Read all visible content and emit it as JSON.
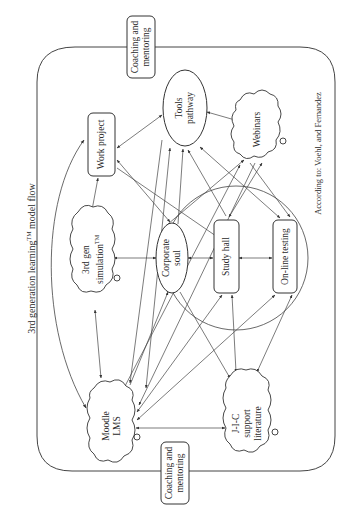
{
  "figure": {
    "title": "3rd generation learning",
    "title_tm": "TM",
    "title_suffix": " model flow",
    "credit": "According to: Voehl, and Fernandez",
    "orientation": "rotated 90 degrees counterclockwise"
  },
  "frame": {
    "label_top": {
      "line1": "Coaching and",
      "line2": "mentoring"
    },
    "label_bottom": {
      "line1": "Coaching and",
      "line2": "mentoring"
    }
  },
  "nodes": {
    "work_project": {
      "label": "Work project",
      "shape": "rounded-rectangle"
    },
    "tools_pathway": {
      "line1": "Tools",
      "line2": "pathway",
      "shape": "ellipse"
    },
    "webinars": {
      "label": "Webinars",
      "shape": "cloud"
    },
    "simulation": {
      "line1": "3rd gen",
      "line2": "simulation",
      "tm": "TM",
      "shape": "cloud"
    },
    "corporate_soul": {
      "line1": "Corporate",
      "line2": "soul",
      "shape": "ellipse"
    },
    "study_hall": {
      "label": "Study hall",
      "shape": "rounded-rectangle"
    },
    "online_testing": {
      "label": "On-line testing",
      "shape": "rounded-rectangle"
    },
    "moodle_lms": {
      "line1": "Moodle",
      "line2": "LMS",
      "shape": "cloud"
    },
    "jic_literature": {
      "line1": "J-I-C",
      "line2": "support",
      "line3": "literature",
      "shape": "cloud"
    }
  },
  "colors": {
    "stroke": "#333333",
    "text": "#2a2a2a",
    "background": "#ffffff"
  }
}
